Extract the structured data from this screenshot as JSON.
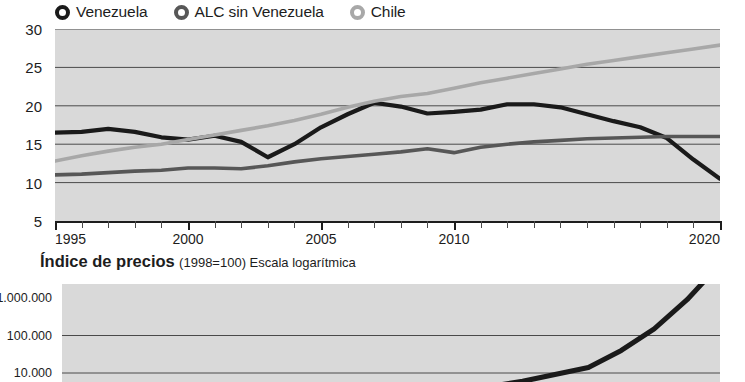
{
  "legend": {
    "items": [
      {
        "label": "Venezuela",
        "color": "#1a1a1a",
        "marker": "circle-marker"
      },
      {
        "label": "ALC sin Venezuela",
        "color": "#575757",
        "marker": "circle-marker"
      },
      {
        "label": "Chile",
        "color": "#a8a8a8",
        "marker": "circle-marker"
      }
    ]
  },
  "chart2_title": {
    "bold": "Índice de precios",
    "sub": "(1998=100) Escala logarítmica"
  },
  "colors": {
    "venezuela": "#1a1a1a",
    "alc": "#575757",
    "chile": "#a8a8a8",
    "plot_bg": "#d9d9d9",
    "gridline": "#4a4a4a",
    "axis": "#1d1d1d",
    "text": "#1d1d1d"
  },
  "chart_data": [
    {
      "type": "line",
      "title": "",
      "xlabel": "",
      "ylabel": "",
      "xlim": [
        1995,
        2020
      ],
      "ylim": [
        5,
        30
      ],
      "yticks": [
        5,
        10,
        15,
        20,
        25,
        30
      ],
      "ytick_labels": [
        "5",
        "10",
        "15",
        "20",
        "25",
        "30"
      ],
      "xticks": [
        1995,
        2000,
        2005,
        2010,
        2020
      ],
      "xtick_labels": [
        "1995",
        "2000",
        "2005",
        "2010",
        "2020"
      ],
      "grid": true,
      "legend_position": "top",
      "x": [
        1995,
        1996,
        1997,
        1998,
        1999,
        2000,
        2001,
        2002,
        2003,
        2004,
        2005,
        2006,
        2007,
        2008,
        2009,
        2010,
        2011,
        2012,
        2013,
        2014,
        2015,
        2016,
        2017,
        2018,
        2019,
        2020
      ],
      "series": [
        {
          "name": "Venezuela",
          "color": "#1a1a1a",
          "values": [
            16.5,
            16.6,
            17.0,
            16.6,
            15.9,
            15.6,
            16.1,
            15.3,
            13.3,
            15.0,
            17.2,
            18.9,
            20.4,
            19.9,
            19.0,
            19.2,
            19.5,
            20.2,
            20.2,
            19.8,
            18.9,
            18.0,
            17.2,
            15.8,
            13.0,
            10.5
          ]
        },
        {
          "name": "ALC sin Venezuela",
          "color": "#575757",
          "values": [
            11.0,
            11.1,
            11.3,
            11.5,
            11.6,
            11.9,
            11.9,
            11.8,
            12.2,
            12.7,
            13.1,
            13.4,
            13.7,
            14.0,
            14.4,
            13.9,
            14.6,
            15.0,
            15.3,
            15.5,
            15.7,
            15.8,
            15.9,
            16.0,
            16.0,
            16.0
          ]
        },
        {
          "name": "Chile",
          "color": "#a8a8a8",
          "values": [
            12.8,
            13.5,
            14.1,
            14.6,
            15.0,
            15.6,
            16.2,
            16.8,
            17.4,
            18.1,
            18.9,
            19.8,
            20.6,
            21.2,
            21.6,
            22.3,
            23.0,
            23.6,
            24.2,
            24.8,
            25.4,
            25.9,
            26.4,
            26.9,
            27.4,
            27.9
          ]
        }
      ]
    },
    {
      "type": "line",
      "title": "Índice de precios (1998=100) Escala logarítmica",
      "xlabel": "",
      "ylabel": "",
      "yscale": "log",
      "yticks": [
        10000,
        100000,
        1000000
      ],
      "ytick_labels": [
        "10.000",
        "100.000",
        "1.000.000"
      ],
      "grid": true,
      "x": [
        1998,
        2000,
        2002,
        2004,
        2006,
        2008,
        2010,
        2012,
        2014,
        2015,
        2016,
        2017,
        2018
      ],
      "series": [
        {
          "name": "Venezuela",
          "color": "#1a1a1a",
          "values": [
            100,
            180,
            320,
            600,
            1000,
            1800,
            3200,
            6000,
            14000,
            40000,
            150000,
            900000,
            8000000
          ]
        }
      ]
    }
  ]
}
